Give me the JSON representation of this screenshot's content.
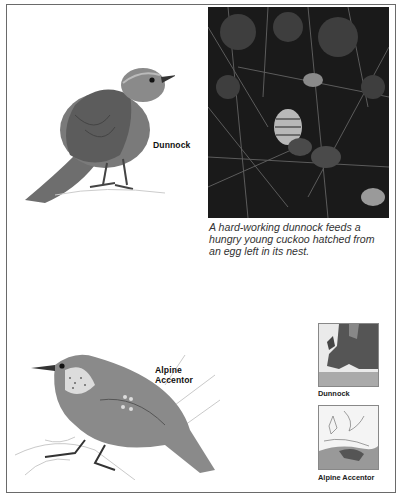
{
  "page": {
    "species": [
      {
        "name": "Dunnock",
        "illustration": "dunnock-illustration"
      },
      {
        "name": "Alpine Accentor",
        "illustration": "alpine-accentor-illustration",
        "label_lines": [
          "Alpine",
          "Accentor"
        ]
      }
    ],
    "photo": {
      "subject": "dunnock feeding young cuckoo in nest",
      "caption": "A hard-working dunnock feeds a hungry young cuckoo hatched from an egg left in its nest.",
      "caption_lines": [
        "A hard-working dunnock feeds a",
        "hungry young cuckoo hatched from",
        "an egg left in its nest."
      ]
    },
    "maps": [
      {
        "label": "Dunnock",
        "region": "Europe"
      },
      {
        "label": "Alpine Accentor",
        "region": "Europe"
      }
    ]
  }
}
